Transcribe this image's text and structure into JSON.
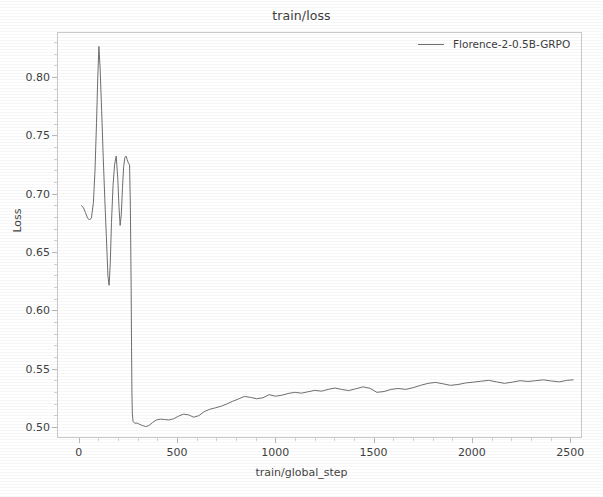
{
  "chart_data": {
    "type": "line",
    "title": "train/loss",
    "xlabel": "train/global_step",
    "ylabel": "Loss",
    "xlim": [
      -110,
      2560
    ],
    "ylim": [
      0.4905,
      0.8385
    ],
    "grid": false,
    "legend_position": "top-right",
    "xticks": [
      0,
      500,
      1000,
      1500,
      2000,
      2500
    ],
    "xtick_labels": [
      "0",
      "500",
      "1000",
      "1500",
      "2000",
      "2500"
    ],
    "yticks": [
      0.5,
      0.55,
      0.6,
      0.65,
      0.7,
      0.75,
      0.8
    ],
    "ytick_labels": [
      "0.50",
      "0.55",
      "0.60",
      "0.65",
      "0.70",
      "0.75",
      "0.80"
    ],
    "line_color": "#6f6f6f",
    "axis_color": "#c9c9c9",
    "series": [
      {
        "name": "Florence-2-0.5B-GRPO",
        "color": "#6f6f6f",
        "x": [
          10,
          20,
          30,
          40,
          50,
          60,
          70,
          78,
          86,
          92,
          98,
          104,
          112,
          120,
          128,
          136,
          144,
          150,
          156,
          162,
          170,
          178,
          186,
          194,
          200,
          206,
          212,
          218,
          224,
          230,
          236,
          242,
          248,
          254,
          258,
          262,
          264,
          266,
          268,
          272,
          280,
          292,
          306,
          320,
          336,
          352,
          370,
          390,
          410,
          432,
          454,
          478,
          502,
          528,
          554,
          580,
          606,
          634,
          662,
          690,
          718,
          748,
          778,
          808,
          838,
          868,
          900,
          932,
          964,
          996,
          1028,
          1060,
          1094,
          1128,
          1162,
          1196,
          1230,
          1264,
          1298,
          1332,
          1368,
          1404,
          1440,
          1476,
          1512,
          1548,
          1584,
          1620,
          1658,
          1696,
          1734,
          1772,
          1810,
          1848,
          1886,
          1924,
          1962,
          2000,
          2040,
          2080,
          2120,
          2160,
          2200,
          2240,
          2280,
          2320,
          2360,
          2400,
          2440,
          2480,
          2510
        ],
        "y": [
          0.6905,
          0.6885,
          0.6845,
          0.68,
          0.6782,
          0.68,
          0.693,
          0.72,
          0.762,
          0.799,
          0.827,
          0.809,
          0.772,
          0.732,
          0.696,
          0.664,
          0.63,
          0.6222,
          0.642,
          0.676,
          0.708,
          0.726,
          0.733,
          0.714,
          0.69,
          0.6735,
          0.683,
          0.706,
          0.724,
          0.7315,
          0.733,
          0.73,
          0.727,
          0.7255,
          0.69,
          0.62,
          0.57,
          0.53,
          0.512,
          0.5055,
          0.504,
          0.5042,
          0.503,
          0.502,
          0.5012,
          0.502,
          0.5045,
          0.5068,
          0.5075,
          0.5072,
          0.5068,
          0.5078,
          0.51,
          0.5118,
          0.5112,
          0.5092,
          0.5105,
          0.514,
          0.516,
          0.5172,
          0.5185,
          0.5205,
          0.5228,
          0.5248,
          0.527,
          0.5262,
          0.525,
          0.5258,
          0.5285,
          0.5272,
          0.528,
          0.5295,
          0.5305,
          0.5298,
          0.531,
          0.5322,
          0.5315,
          0.533,
          0.5342,
          0.533,
          0.532,
          0.5335,
          0.5352,
          0.534,
          0.5305,
          0.5312,
          0.533,
          0.5338,
          0.533,
          0.5345,
          0.5365,
          0.5382,
          0.539,
          0.5378,
          0.5365,
          0.5372,
          0.5385,
          0.5392,
          0.54,
          0.5408,
          0.5395,
          0.5382,
          0.5392,
          0.5405,
          0.5398,
          0.5405,
          0.5412,
          0.5402,
          0.5395,
          0.5408,
          0.5412
        ]
      }
    ]
  },
  "legend": {
    "entries": [
      {
        "label": "Florence-2-0.5B-GRPO"
      }
    ]
  }
}
